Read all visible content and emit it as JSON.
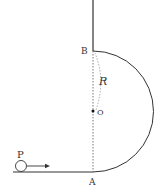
{
  "diagram": {
    "labels": {
      "P": "P",
      "A": "A",
      "B": "B",
      "O": "O",
      "R": "R"
    },
    "colors": {
      "line": "#333333",
      "dashed": "#555555",
      "background": "#ffffff"
    }
  }
}
